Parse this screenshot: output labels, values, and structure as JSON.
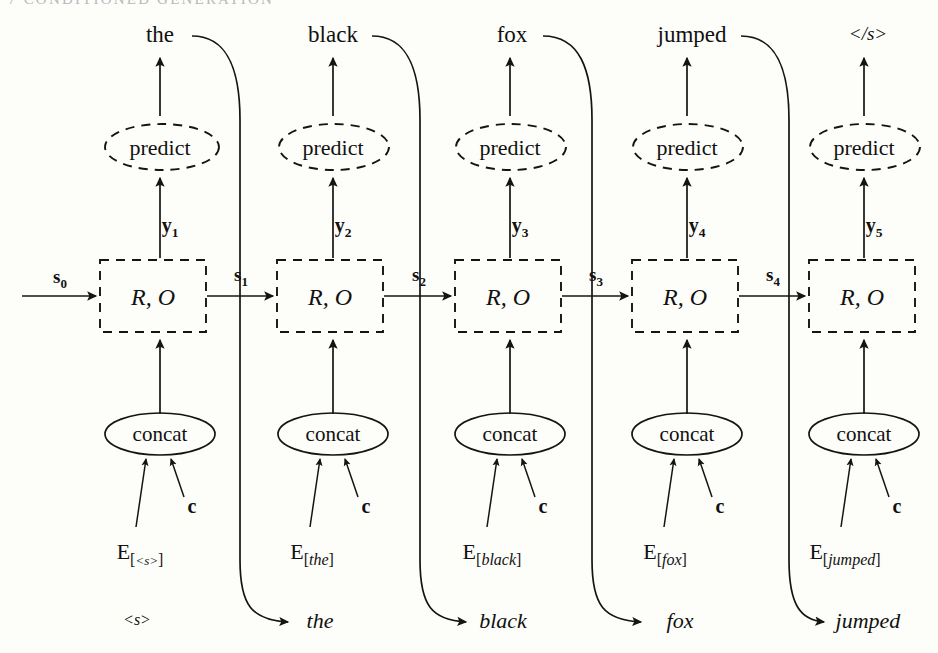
{
  "page": {
    "running_head": "7  CONDITIONED GENERATION",
    "width": 938,
    "height": 653,
    "background_color": "#fdfdfa",
    "ink_color": "#141414"
  },
  "diagram": {
    "type": "conditioned-generation-rnn-unrolled",
    "context_label": "c",
    "cell_label": "R, O",
    "predict_label": "predict",
    "concat_label": "concat",
    "initial_state": "s",
    "initial_state_sub": "0",
    "columns": [
      {
        "index": 0,
        "output_word": "the",
        "input_token": "<s>",
        "embedding_base": "E",
        "embedding_token": "<s>",
        "state_label": "s",
        "state_sub": "1",
        "y_label": "y",
        "y_sub": "1",
        "cell_label": "R, O",
        "predict_label": "predict",
        "concat_label": "concat",
        "context_label": "c"
      },
      {
        "index": 1,
        "output_word": "black",
        "input_token": "the",
        "embedding_base": "E",
        "embedding_token": "the",
        "state_label": "s",
        "state_sub": "2",
        "y_label": "y",
        "y_sub": "2",
        "cell_label": "R, O",
        "predict_label": "predict",
        "concat_label": "concat",
        "context_label": "c"
      },
      {
        "index": 2,
        "output_word": "fox",
        "input_token": "black",
        "embedding_base": "E",
        "embedding_token": "black",
        "state_label": "s",
        "state_sub": "3",
        "y_label": "y",
        "y_sub": "3",
        "cell_label": "R, O",
        "predict_label": "predict",
        "concat_label": "concat",
        "context_label": "c"
      },
      {
        "index": 3,
        "output_word": "jumped",
        "input_token": "fox",
        "embedding_base": "E",
        "embedding_token": "fox",
        "state_label": "s",
        "state_sub": "4",
        "y_label": "y",
        "y_sub": "4",
        "cell_label": "R, O",
        "predict_label": "predict",
        "concat_label": "concat",
        "context_label": "c"
      },
      {
        "index": 4,
        "output_word": "</s>",
        "input_token": "jumped",
        "embedding_base": "E",
        "embedding_token": "jumped",
        "state_label": "",
        "state_sub": "",
        "y_label": "y",
        "y_sub": "5",
        "cell_label": "R, O",
        "predict_label": "predict",
        "concat_label": "concat",
        "context_label": "c"
      }
    ]
  }
}
